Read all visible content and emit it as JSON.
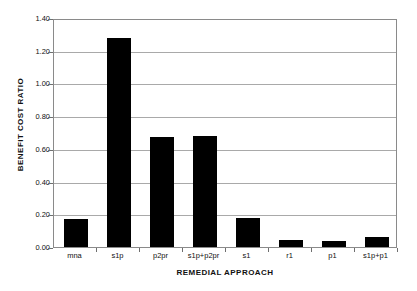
{
  "chart_data": {
    "type": "bar",
    "title": "",
    "subtitle": "",
    "xlabel": "REMEDIAL APPROACH",
    "ylabel": "BENEFIT COST RATIO",
    "categories": [
      "mna",
      "s1p",
      "p2pr",
      "s1p+p2pr",
      "s1",
      "r1",
      "p1",
      "s1p+p1"
    ],
    "values": [
      0.17,
      1.28,
      0.675,
      0.68,
      0.18,
      0.04,
      0.035,
      0.06
    ],
    "series": [
      {
        "name": "Benefit Cost Ratio",
        "values": [
          0.17,
          1.28,
          0.675,
          0.68,
          0.18,
          0.04,
          0.035,
          0.06
        ]
      }
    ],
    "ylim": [
      0.0,
      1.4
    ],
    "ytick_values": [
      0.0,
      0.2,
      0.4,
      0.6,
      0.8,
      1.0,
      1.2,
      1.4
    ],
    "ytick_labels": [
      "0.00",
      "0.20",
      "0.40",
      "0.60",
      "0.80",
      "1.00",
      "1.20",
      "1.40"
    ],
    "grid": true,
    "grid_axis": "y",
    "legend": false,
    "legend_position": "none",
    "bar_color": "#000000",
    "plot_background": "#ffffff",
    "frame_color": "#8a8a8a",
    "gridline_color": "#a9a9a9",
    "annotations": []
  },
  "axes": {
    "y_title": "BENEFIT COST RATIO",
    "x_title": "REMEDIAL APPROACH"
  }
}
